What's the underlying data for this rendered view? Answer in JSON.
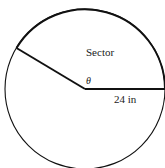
{
  "diagram": {
    "type": "circle-sector",
    "labels": {
      "sector": "Sector",
      "angle": "θ",
      "radius": "24 in"
    },
    "colors": {
      "stroke": "#111111",
      "background": "#ffffff"
    }
  }
}
